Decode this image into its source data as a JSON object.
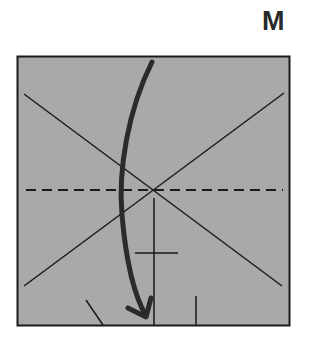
{
  "diagram": {
    "step_label": "M",
    "paper_color": "#a9a9a9",
    "line_color": "#1a1a1a",
    "elements": {
      "square": {
        "x": 17,
        "y": 56,
        "w": 272,
        "h": 269
      },
      "crease_diagonal_1": "top-left to bottom-right",
      "crease_diagonal_2": "bottom-left to top-right",
      "valley_fold_line": "horizontal dashed through center",
      "fold_arrow": "curved arrow from top edge down to bottom edge"
    }
  }
}
